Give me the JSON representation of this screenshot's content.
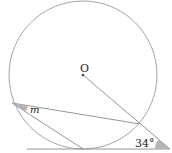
{
  "diagram": {
    "center_label": "O",
    "angle_m_label": "m",
    "angle_given_label": "34°",
    "colors": {
      "stroke": "#8a8a8a",
      "shade": "#b5b5b5",
      "text": "#222222"
    },
    "geometry": {
      "circle": {
        "cx": 83,
        "cy": 75,
        "r": 74
      },
      "center": {
        "x": 83,
        "y": 75
      },
      "tangent_point": {
        "x": 83,
        "y": 149
      },
      "left_point": {
        "x": 12,
        "y": 103
      },
      "external_point": {
        "x": 170,
        "y": 149
      },
      "secant_intersection": {
        "x": 140,
        "y": 124
      },
      "baseline": {
        "x1": 27,
        "x2": 170,
        "y": 149
      }
    }
  }
}
